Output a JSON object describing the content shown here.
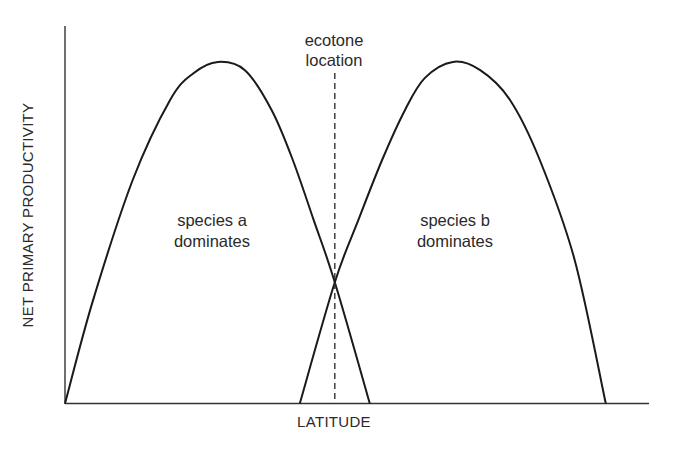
{
  "chart_data": {
    "type": "line",
    "title": "",
    "xlabel": "LATITUDE",
    "ylabel": "NET PRIMARY PRODUCTIVITY",
    "xlim": [
      0,
      100
    ],
    "ylim": [
      0,
      100
    ],
    "grid": false,
    "ticks": false,
    "series": [
      {
        "name": "species a",
        "label": [
          "species a",
          "dominates"
        ],
        "points": [
          [
            0,
            0
          ],
          [
            4.8,
            27.3
          ],
          [
            11.6,
            59.2
          ],
          [
            18.0,
            80.4
          ],
          [
            22.0,
            87.5
          ],
          [
            26.2,
            90.5
          ],
          [
            30.8,
            88.3
          ],
          [
            35.4,
            77.7
          ],
          [
            39.0,
            64.5
          ],
          [
            42.6,
            48.5
          ],
          [
            46.2,
            32.1
          ],
          [
            52.2,
            0
          ]
        ]
      },
      {
        "name": "species b",
        "label": [
          "species b",
          "dominates"
        ],
        "points": [
          [
            40.2,
            0
          ],
          [
            46.2,
            32.1
          ],
          [
            50.2,
            48.5
          ],
          [
            54.3,
            64.5
          ],
          [
            58.2,
            77.7
          ],
          [
            61.6,
            86.2
          ],
          [
            66.4,
            90.5
          ],
          [
            71.1,
            88.3
          ],
          [
            76.2,
            80.4
          ],
          [
            81.3,
            64.5
          ],
          [
            87.3,
            37.9
          ],
          [
            92.6,
            0
          ]
        ]
      }
    ],
    "annotations": [
      {
        "type": "vertical-dashed-line",
        "x": 46.2,
        "text": [
          "ecotone",
          "location"
        ]
      }
    ],
    "color": "#1a1a1a"
  }
}
